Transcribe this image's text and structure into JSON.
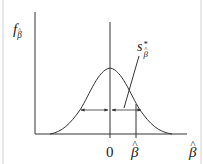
{
  "figure": {
    "type": "sampling-distribution-diagram",
    "y_axis_label": {
      "base": "f",
      "subscript": "β",
      "subscript_hat": true
    },
    "x_axis_label": {
      "symbol": "β",
      "hat": true
    },
    "tick_zero": "0",
    "tick_estimate": {
      "symbol": "β",
      "hat": true
    },
    "spread_label": {
      "base": "s",
      "superscript": "*",
      "subscript": "β",
      "subscript_hat": true
    },
    "colors": {
      "line": "#333333",
      "background": "#ffffff",
      "frame": "#cfcfcf"
    }
  }
}
